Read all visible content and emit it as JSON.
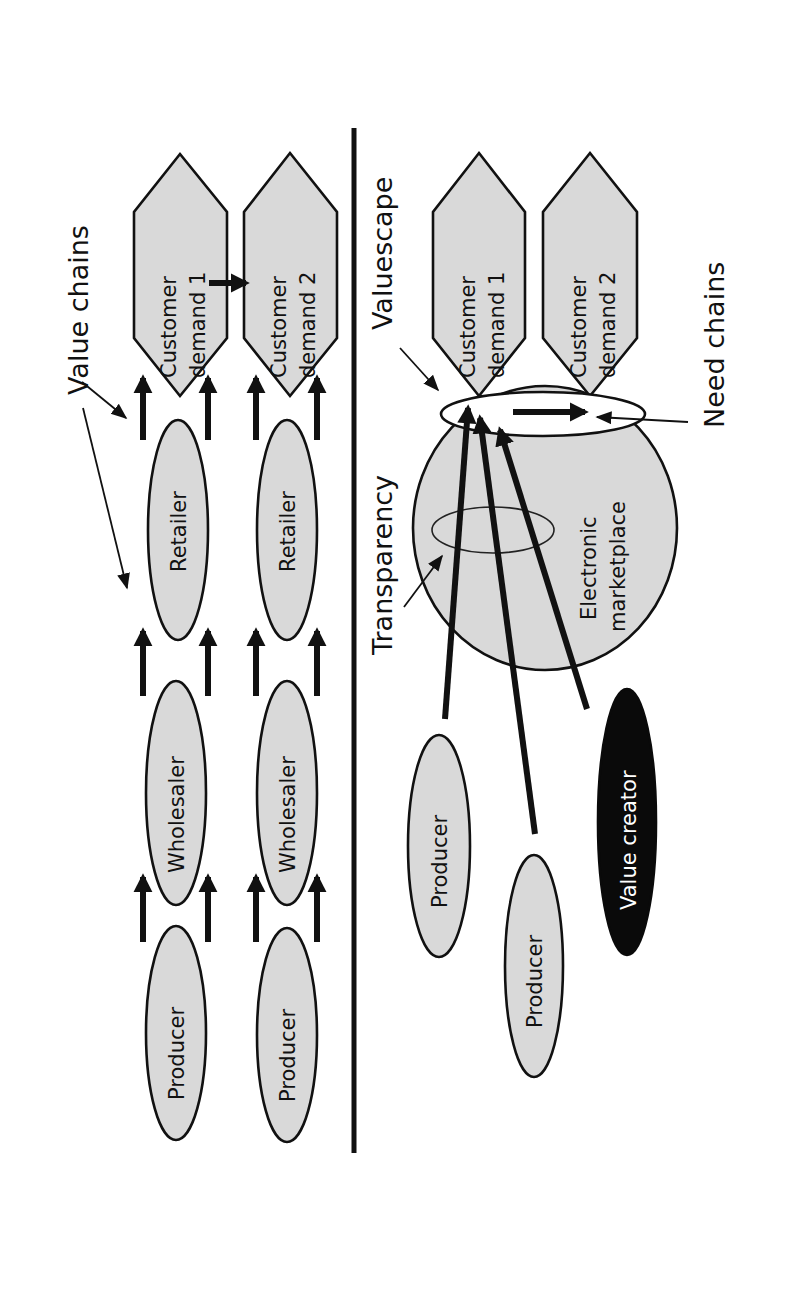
{
  "diagram": {
    "orientation": "rotated -90deg (text reads bottom-to-top)",
    "colors": {
      "node_fill": "#d9d9d9",
      "outline": "#111111",
      "value_creator_fill": "#0a0a0a",
      "background": "#ffffff"
    },
    "top_panel": {
      "title": "Value chains",
      "chains": [
        {
          "nodes": [
            "Producer",
            "Wholesaler",
            "Retailer"
          ],
          "demand": {
            "line1": "Customer",
            "line2": "demand 1"
          }
        },
        {
          "nodes": [
            "Producer",
            "Wholesaler",
            "Retailer"
          ],
          "demand": {
            "line1": "Customer",
            "line2": "demand 2"
          }
        }
      ]
    },
    "bottom_panel": {
      "valuescape_label": "Valuescape",
      "transparency_label": "Transparency",
      "need_chains_label": "Need chains",
      "marketplace": {
        "line1": "Electronic",
        "line2": "marketplace"
      },
      "demands": [
        {
          "line1": "Customer",
          "line2": "demand 1"
        },
        {
          "line1": "Customer",
          "line2": "demand 2"
        }
      ],
      "suppliers": [
        "Producer",
        "Producer",
        "Value creator"
      ]
    }
  }
}
